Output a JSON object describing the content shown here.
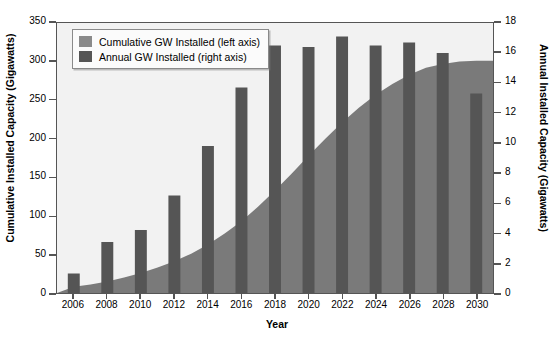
{
  "chart_data": {
    "type": "bar",
    "title": "",
    "subtitle": "",
    "xlabel": "Year",
    "ylabel": "Cumulative Installed Capacity (Gigawatts)",
    "y2label": "Annual Installed Capacity (Gigawatts)",
    "grid": false,
    "legend_position": "top-left",
    "categories": [
      2006,
      2008,
      2010,
      2012,
      2014,
      2016,
      2018,
      2020,
      2022,
      2024,
      2026,
      2028,
      2030
    ],
    "x": [
      2006,
      2007,
      2008,
      2009,
      2010,
      2011,
      2012,
      2013,
      2014,
      2015,
      2016,
      2017,
      2018,
      2019,
      2020,
      2021,
      2022,
      2023,
      2024,
      2025,
      2026,
      2027,
      2028,
      2029,
      2030
    ],
    "xlim": [
      2005,
      2031
    ],
    "ylim": [
      0,
      350
    ],
    "y2lim": [
      0,
      18
    ],
    "yticks": [
      0,
      50,
      100,
      150,
      200,
      250,
      300,
      350
    ],
    "y2ticks": [
      0,
      2,
      4,
      6,
      8,
      10,
      12,
      14,
      16,
      18
    ],
    "xticks": [
      2006,
      2008,
      2010,
      2012,
      2014,
      2016,
      2018,
      2020,
      2022,
      2024,
      2026,
      2028,
      2030
    ],
    "series": [
      {
        "name": "Annual GW Installed (right axis)",
        "type": "bar",
        "axis": "right",
        "units": "GW",
        "color": "#555555",
        "categories": [
          2006,
          2008,
          2010,
          2012,
          2014,
          2016,
          2018,
          2020,
          2022,
          2024,
          2026,
          2028,
          2030
        ],
        "values": [
          1.3,
          3.4,
          4.2,
          6.5,
          9.8,
          13.7,
          16.5,
          16.4,
          17.1,
          16.5,
          16.7,
          16.0,
          13.3
        ]
      },
      {
        "name": "Cumulative GW Installed (left axis)",
        "type": "area",
        "axis": "left",
        "units": "GW",
        "color": "#7a7a7a",
        "x": [
          2006,
          2007,
          2008,
          2009,
          2010,
          2011,
          2012,
          2013,
          2014,
          2015,
          2016,
          2017,
          2018,
          2019,
          2020,
          2021,
          2022,
          2023,
          2024,
          2025,
          2026,
          2027,
          2028,
          2029,
          2030
        ],
        "values": [
          8,
          11,
          15,
          20,
          26,
          33,
          41,
          51,
          63,
          77,
          93,
          112,
          133,
          155,
          178,
          200,
          221,
          240,
          257,
          271,
          283,
          292,
          297,
          300,
          301
        ]
      }
    ]
  },
  "legend": {
    "items": [
      {
        "label": "Cumulative GW Installed (left axis)",
        "color": "#8a8a8a"
      },
      {
        "label": "Annual GW Installed (right axis)",
        "color": "#555555"
      }
    ]
  },
  "axes": {
    "x_title": "Year",
    "y_left_title": "Cumulative Installed Capacity (Gigawatts)",
    "y_right_title": "Annual Installed Capacity (Gigawatts)",
    "y_left_ticks": [
      "350",
      "300",
      "250",
      "200",
      "150",
      "100",
      "50",
      "0"
    ],
    "y_right_ticks": [
      "18",
      "16",
      "14",
      "12",
      "10",
      "8",
      "6",
      "4",
      "2",
      "0"
    ],
    "x_ticks": [
      "2006",
      "2008",
      "2010",
      "2012",
      "2014",
      "2016",
      "2018",
      "2020",
      "2022",
      "2024",
      "2026",
      "2028",
      "2030"
    ]
  },
  "colors": {
    "plot_background": "#f2f2f2",
    "axis": "#555555",
    "bar": "#555555",
    "area": "#7a7a7a",
    "text": "#000000"
  }
}
